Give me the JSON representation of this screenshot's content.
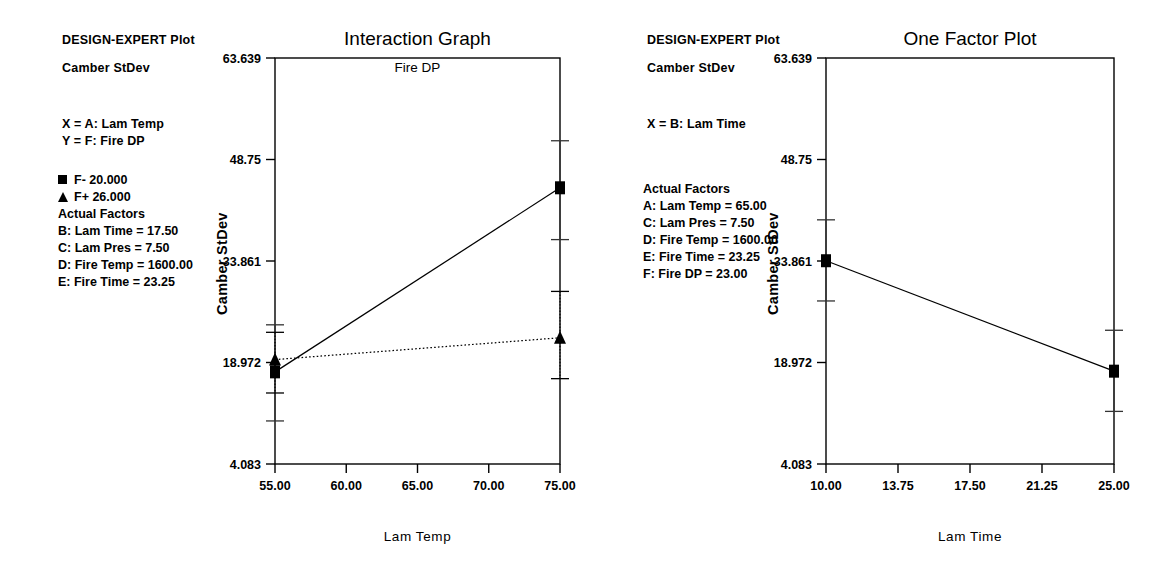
{
  "panels": [
    {
      "header": "DESIGN-EXPERT Plot",
      "response": "Camber StDev",
      "title": "Interaction Graph",
      "subtitle": "Fire DP",
      "axis_defs": [
        "X = A: Lam Temp",
        "Y = F: Fire DP"
      ],
      "legend": [
        {
          "glyph": "filled-square",
          "label": "F- 20.000"
        },
        {
          "glyph": "filled-triangle",
          "label": "F+ 26.000"
        }
      ],
      "factors_heading": "Actual Factors",
      "factors": [
        "B: Lam Time = 17.50",
        "C: Lam Pres = 7.50",
        "D: Fire Temp = 1600.00",
        "E: Fire Time = 23.25"
      ],
      "chart_data": {
        "type": "line",
        "title": "Interaction Graph",
        "subtitle": "Fire DP",
        "xlabel": "Lam Temp",
        "ylabel": "Camber StDev",
        "xlim": [
          55.0,
          75.0
        ],
        "ylim": [
          4.083,
          63.639
        ],
        "xticks": [
          "55.00",
          "60.00",
          "65.00",
          "70.00",
          "75.00"
        ],
        "xtick_values": [
          55.0,
          60.0,
          65.0,
          70.0,
          75.0
        ],
        "yticks": [
          "63.639",
          "48.75",
          "33.861",
          "18.972",
          "4.083"
        ],
        "ytick_values": [
          63.639,
          48.75,
          33.861,
          18.972,
          4.083
        ],
        "grid": false,
        "legend_position": "outside-left",
        "series": [
          {
            "name": "F- 20.000",
            "marker": "filled-square",
            "linestyle": "solid",
            "x": [
              55.0,
              75.0
            ],
            "values": [
              17.6,
              44.6
            ],
            "err_low": [
              10.4,
              37.0
            ],
            "err_high": [
              24.5,
              51.5
            ]
          },
          {
            "name": "F+ 26.000",
            "marker": "filled-triangle",
            "linestyle": "dotted",
            "x": [
              55.0,
              75.0
            ],
            "values": [
              19.4,
              22.6
            ],
            "err_low": [
              14.5,
              16.6
            ],
            "err_high": [
              23.4,
              29.4
            ]
          }
        ]
      }
    },
    {
      "header": "DESIGN-EXPERT Plot",
      "response": "Camber StDev",
      "title": "One Factor Plot",
      "subtitle": "",
      "axis_defs": [
        "X = B: Lam Time"
      ],
      "legend": [],
      "factors_heading": "Actual Factors",
      "factors": [
        "A: Lam Temp = 65.00",
        "C: Lam Pres = 7.50",
        "D: Fire Temp = 1600.00",
        "E: Fire Time = 23.25",
        "F: Fire DP = 23.00"
      ],
      "chart_data": {
        "type": "line",
        "title": "One Factor Plot",
        "subtitle": "",
        "xlabel": "Lam Time",
        "ylabel": "Camber StDev",
        "xlim": [
          10.0,
          25.0
        ],
        "ylim": [
          4.083,
          63.639
        ],
        "xticks": [
          "10.00",
          "13.75",
          "17.50",
          "21.25",
          "25.00"
        ],
        "xtick_values": [
          10.0,
          13.75,
          17.5,
          21.25,
          25.0
        ],
        "yticks": [
          "63.639",
          "48.75",
          "33.861",
          "18.972",
          "4.083"
        ],
        "ytick_values": [
          63.639,
          48.75,
          33.861,
          18.972,
          4.083
        ],
        "grid": false,
        "legend_position": "none",
        "series": [
          {
            "name": "Camber StDev",
            "marker": "filled-square",
            "linestyle": "solid",
            "x": [
              10.0,
              25.0
            ],
            "values": [
              33.9,
              17.7
            ],
            "err_low": [
              28.0,
              11.8
            ],
            "err_high": [
              39.9,
              23.7
            ]
          }
        ]
      }
    }
  ],
  "colors": {
    "ink": "#000000",
    "background": "#ffffff",
    "error_bar": "#555555"
  }
}
